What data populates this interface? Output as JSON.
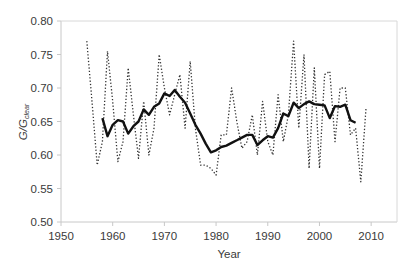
{
  "chart_data": {
    "type": "line",
    "title": "",
    "xlabel": "Year",
    "ylabel": "G/G_clear",
    "ylabel_main": "G/G",
    "ylabel_sub": "clear",
    "xlim": [
      1950,
      2015
    ],
    "ylim": [
      0.5,
      0.8
    ],
    "x_ticks": [
      1950,
      1960,
      1970,
      1980,
      1990,
      2000,
      2010
    ],
    "x_tick_labels": [
      "1950",
      "1960",
      "1970",
      "1980",
      "1990",
      "2000",
      "2010"
    ],
    "y_ticks": [
      0.5,
      0.55,
      0.6,
      0.65,
      0.7,
      0.75,
      0.8
    ],
    "y_tick_labels": [
      "0.50",
      "0.55",
      "0.60",
      "0.65",
      "0.70",
      "0.75",
      "0.80"
    ],
    "grid": false,
    "legend": null,
    "series": [
      {
        "name": "annual",
        "style": "dotted",
        "color": "#333333",
        "x": [
          1955,
          1956,
          1957,
          1958,
          1959,
          1960,
          1961,
          1962,
          1963,
          1964,
          1965,
          1966,
          1967,
          1968,
          1969,
          1970,
          1971,
          1972,
          1973,
          1974,
          1975,
          1976,
          1977,
          1978,
          1979,
          1980,
          1981,
          1982,
          1983,
          1984,
          1985,
          1986,
          1987,
          1988,
          1989,
          1990,
          1991,
          1992,
          1993,
          1994,
          1995,
          1996,
          1997,
          1998,
          1999,
          2000,
          2001,
          2002,
          2003,
          2004,
          2005,
          2006,
          2007,
          2008,
          2009
        ],
        "values": [
          0.77,
          0.68,
          0.585,
          0.62,
          0.755,
          0.68,
          0.59,
          0.62,
          0.73,
          0.66,
          0.595,
          0.68,
          0.6,
          0.64,
          0.75,
          0.7,
          0.66,
          0.69,
          0.72,
          0.64,
          0.74,
          0.64,
          0.585,
          0.585,
          0.58,
          0.57,
          0.63,
          0.63,
          0.7,
          0.65,
          0.61,
          0.62,
          0.66,
          0.6,
          0.68,
          0.62,
          0.6,
          0.69,
          0.62,
          0.66,
          0.77,
          0.64,
          0.75,
          0.58,
          0.73,
          0.58,
          0.72,
          0.725,
          0.62,
          0.7,
          0.7,
          0.63,
          0.64,
          0.56,
          0.67
        ]
      },
      {
        "name": "smoothed",
        "style": "solid",
        "color": "#111111",
        "x": [
          1958,
          1959,
          1960,
          1961,
          1962,
          1963,
          1964,
          1965,
          1966,
          1967,
          1968,
          1969,
          1970,
          1971,
          1972,
          1973,
          1974,
          1975,
          1976,
          1977,
          1978,
          1979,
          1980,
          1981,
          1982,
          1983,
          1984,
          1985,
          1986,
          1987,
          1988,
          1989,
          1990,
          1991,
          1992,
          1993,
          1994,
          1995,
          1996,
          1997,
          1998,
          1999,
          2000,
          2001,
          2002,
          2003,
          2004,
          2005,
          2006,
          2007
        ],
        "values": [
          0.655,
          0.628,
          0.645,
          0.652,
          0.65,
          0.632,
          0.643,
          0.65,
          0.668,
          0.66,
          0.672,
          0.677,
          0.692,
          0.688,
          0.697,
          0.687,
          0.678,
          0.662,
          0.645,
          0.632,
          0.617,
          0.604,
          0.607,
          0.612,
          0.614,
          0.618,
          0.622,
          0.626,
          0.63,
          0.63,
          0.615,
          0.622,
          0.628,
          0.626,
          0.64,
          0.662,
          0.658,
          0.678,
          0.67,
          0.676,
          0.68,
          0.676,
          0.675,
          0.674,
          0.655,
          0.673,
          0.672,
          0.675,
          0.652,
          0.648
        ]
      }
    ]
  }
}
